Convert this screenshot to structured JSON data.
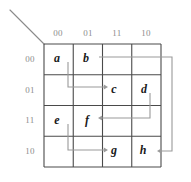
{
  "diagram": {
    "type": "karnaugh-map",
    "grid": {
      "rows": 4,
      "cols": 4,
      "left": 44,
      "top": 44,
      "right": 161,
      "bottom": 167,
      "cell_w": 29.25,
      "cell_h": 30.75,
      "line_color": "#4a4a4a",
      "line_width": 1.1
    },
    "colors": {
      "grid_line": "#4a4a4a",
      "routing_line": "#9a9a9a",
      "axis_label": "#8c8c8c",
      "cell_text": "#1a1a1a",
      "corner_diagonal": "#8a8a8a",
      "background": "#ffffff"
    },
    "corner_diagonal": {
      "x1": 10,
      "y1": 10,
      "x2": 44,
      "y2": 44
    },
    "column_headers": [
      {
        "label": "00",
        "x": 58,
        "y": 33
      },
      {
        "label": "01",
        "x": 88,
        "y": 33
      },
      {
        "label": "11",
        "x": 117,
        "y": 33
      },
      {
        "label": "10",
        "x": 146,
        "y": 33
      }
    ],
    "row_headers": [
      {
        "label": "00",
        "x": 30,
        "y": 59
      },
      {
        "label": "01",
        "x": 30,
        "y": 90
      },
      {
        "label": "11",
        "x": 30,
        "y": 120
      },
      {
        "label": "10",
        "x": 30,
        "y": 151
      }
    ],
    "cells": [
      {
        "label": "a",
        "row": 0,
        "col": 0,
        "x": 57,
        "y": 58
      },
      {
        "label": "b",
        "row": 0,
        "col": 1,
        "x": 86,
        "y": 58
      },
      {
        "label": "c",
        "row": 1,
        "col": 2,
        "x": 114,
        "y": 89
      },
      {
        "label": "d",
        "row": 1,
        "col": 3,
        "x": 144,
        "y": 89
      },
      {
        "label": "e",
        "row": 2,
        "col": 0,
        "x": 57,
        "y": 120
      },
      {
        "label": "f",
        "row": 2,
        "col": 1,
        "x": 87,
        "y": 120
      },
      {
        "label": "g",
        "row": 3,
        "col": 2,
        "x": 114,
        "y": 150
      },
      {
        "label": "h",
        "row": 3,
        "col": 3,
        "x": 143,
        "y": 150
      }
    ],
    "arrows": [
      {
        "name": "arrow-a-to-c",
        "from": "a",
        "to": "c",
        "path": "M 68,62 L 68,87 L 106,87",
        "head": {
          "x": 108,
          "y": 87,
          "dir": "right"
        }
      },
      {
        "name": "arrow-b-to-h",
        "from": "b",
        "to": "h",
        "path": "M 99,57 L 172,57 L 172,151 L 159,151",
        "head": {
          "x": 157,
          "y": 151,
          "dir": "left"
        }
      },
      {
        "name": "arrow-d-to-f",
        "from": "d",
        "to": "f",
        "path": "M 150,93 L 150,118 L 100,118",
        "head": {
          "x": 98,
          "y": 118,
          "dir": "left"
        }
      },
      {
        "name": "arrow-e-to-g",
        "from": "e",
        "to": "g",
        "path": "M 68,124 L 68,150 L 106,150",
        "head": {
          "x": 108,
          "y": 150,
          "dir": "right"
        }
      }
    ]
  }
}
